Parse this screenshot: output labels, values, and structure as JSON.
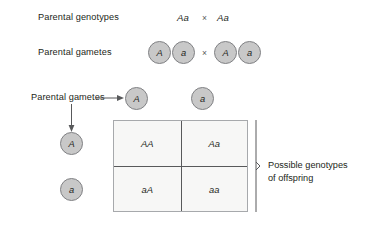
{
  "diagram": {
    "colors": {
      "circle_fill": "#c8c8c8",
      "circle_stroke": "#808184",
      "grid_fill": "#f7f7f6",
      "grid_stroke": "#a7a9ac",
      "grid_divider": "#58595b",
      "text": "#231f20",
      "connector": "#58595b"
    },
    "rows": {
      "parental_genotypes": {
        "label": "Parental genotypes",
        "parent1": "Aa",
        "cross_symbol": "×",
        "parent2": "Aa"
      },
      "parental_gametes_top": {
        "label": "Parental gametes",
        "cross_symbol": "×",
        "parent1_gametes": [
          "A",
          "a"
        ],
        "parent2_gametes": [
          "A",
          "a"
        ]
      },
      "parental_gametes_axes": {
        "label": "Parental gametes",
        "column_gametes": [
          "A",
          "a"
        ],
        "row_gametes": [
          "A",
          "a"
        ]
      }
    },
    "punnett_square": {
      "cells": [
        {
          "id": "cell-aa-dominant",
          "value": "AA"
        },
        {
          "id": "cell-aa-hetero-1",
          "value": "Aa"
        },
        {
          "id": "cell-aa-hetero-2",
          "value": "aA"
        },
        {
          "id": "cell-aa-recessive",
          "value": "aa"
        }
      ],
      "bracket_label_line1": "Possible genotypes",
      "bracket_label_line2": "of offspring"
    }
  }
}
